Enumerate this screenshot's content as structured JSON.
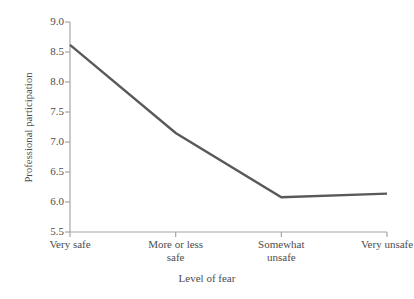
{
  "chart_data": {
    "type": "line",
    "title": "",
    "xlabel": "Level of fear",
    "ylabel": "Professional participation",
    "categories": [
      "Very safe",
      "More or less safe",
      "Somewhat unsafe",
      "Very unsafe"
    ],
    "category_lines": [
      [
        "Very safe"
      ],
      [
        "More or less",
        "safe"
      ],
      [
        "Somewhat",
        "unsafe"
      ],
      [
        "Very unsafe"
      ]
    ],
    "values": [
      8.62,
      7.15,
      6.08,
      6.14
    ],
    "series": [
      {
        "name": "Professional participation",
        "values": [
          8.62,
          7.15,
          6.08,
          6.14
        ]
      }
    ],
    "ylim": [
      5.5,
      9.0
    ],
    "ytick_step": 0.5,
    "yticks": [
      "9.0",
      "8.5",
      "8.0",
      "7.5",
      "7.0",
      "6.5",
      "6.0",
      "5.5"
    ],
    "ytick_values": [
      9.0,
      8.5,
      8.0,
      7.5,
      7.0,
      6.5,
      6.0,
      5.5
    ],
    "grid": false,
    "legend": false,
    "legend_position": "none",
    "line_color": "#595959",
    "axis_color": "#a6a6a6",
    "background_color": "#ffffff"
  }
}
